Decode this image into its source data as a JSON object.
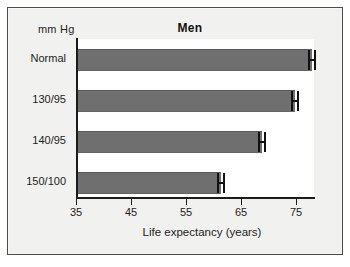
{
  "figure": {
    "units_label": "mm Hg",
    "title": "Men",
    "axis_title": "Life expectancy (years)"
  },
  "chart_data": {
    "type": "bar",
    "orientation": "horizontal",
    "title": "Men",
    "xlabel": "Life expectancy (years)",
    "ylabel": "mm Hg",
    "categories": [
      "Normal",
      "130/95",
      "140/95",
      "150/100"
    ],
    "values": [
      77.5,
      74.5,
      68.5,
      61
    ],
    "error_bars": [
      {
        "category": "Normal",
        "center": 77.5,
        "low": 76.8,
        "high": 78.2
      },
      {
        "category": "130/95",
        "center": 74.5,
        "low": 73.8,
        "high": 75.2
      },
      {
        "category": "140/95",
        "center": 68.5,
        "low": 67.8,
        "high": 69.2
      },
      {
        "category": "150/100",
        "center": 61.0,
        "low": 60.3,
        "high": 61.7
      }
    ],
    "xlim": [
      35,
      78
    ],
    "xticks": [
      35,
      45,
      55,
      65,
      75
    ],
    "xtick_labels": [
      "35",
      "45",
      "55",
      "65",
      "75"
    ],
    "grid": false,
    "legend": null,
    "bar_color": "#6f6f6f",
    "plot_background": "#ffffff",
    "figure_background": "#f1f1ef",
    "axis_color": "#1b1b1b"
  }
}
